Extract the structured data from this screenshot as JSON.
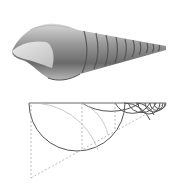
{
  "figure": {
    "shell_illustration": {
      "description": "Grayscale drawing of an elongated spiral shell, aperture at left, tapering spire to the right",
      "colors": {
        "light": "#e6e6e6",
        "mid": "#a0a0a0",
        "dark": "#505050"
      }
    },
    "construction_diagram": {
      "description": "Sequence of nested semicircles hanging below a horizontal line, shrinking geometrically toward the right, with dashed construction lines",
      "line_color": "#555555",
      "dash_color": "#aaaaaa"
    }
  }
}
